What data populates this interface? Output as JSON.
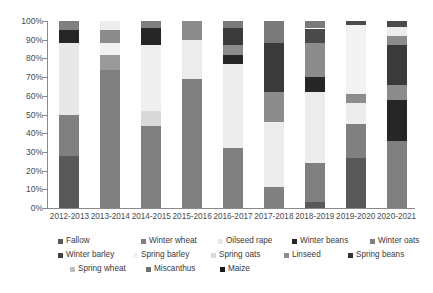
{
  "chart_data": {
    "type": "bar",
    "subtype": "stacked-percentage",
    "title": "",
    "xlabel": "",
    "ylabel": "",
    "ylim": [
      0,
      100
    ],
    "ytick_labels": [
      "0%",
      "10%",
      "20%",
      "30%",
      "40%",
      "50%",
      "60%",
      "70%",
      "80%",
      "90%",
      "100%"
    ],
    "ytick_values": [
      0,
      10,
      20,
      30,
      40,
      50,
      60,
      70,
      80,
      90,
      100
    ],
    "grid": false,
    "legend_position": "bottom",
    "categories": [
      "2012-2013",
      "2013-2014",
      "2014-2015",
      "2015-2016",
      "2016-2017",
      "2017-2018",
      "2018-2019",
      "2019-2020",
      "2020-2021"
    ],
    "series": [
      {
        "name": "Fallow",
        "color": "#595959",
        "values": [
          28,
          0,
          0,
          0,
          0,
          0,
          3,
          27,
          0
        ]
      },
      {
        "name": "Winter wheat",
        "color": "#808080",
        "values": [
          22,
          74,
          44,
          69,
          32,
          11,
          21,
          18,
          36
        ]
      },
      {
        "name": "Oilseed rape",
        "color": "#e8e8e8",
        "values": [
          38,
          8,
          8,
          21,
          45,
          35,
          38,
          11,
          0
        ]
      },
      {
        "name": "Winter beans",
        "color": "#262626",
        "values": [
          7,
          6,
          0,
          0,
          5,
          0,
          8,
          0,
          22
        ]
      },
      {
        "name": "Winter oats",
        "color": "#7f7f7f",
        "values": [
          5,
          0,
          0,
          0,
          0,
          0,
          0,
          5,
          8
        ]
      },
      {
        "name": "Winter barley",
        "color": "#404040",
        "values": [
          0,
          7,
          0,
          0,
          0,
          0,
          0,
          0,
          0
        ]
      },
      {
        "name": "Spring barley",
        "color": "#f2f2f2",
        "values": [
          0,
          5,
          35,
          0,
          0,
          0,
          0,
          37,
          0
        ]
      },
      {
        "name": "Spring oats",
        "color": "#d9d9d9",
        "values": [
          0,
          0,
          0,
          10,
          0,
          0,
          0,
          0,
          0
        ]
      },
      {
        "name": "Linseed",
        "color": "#8c8c8c",
        "values": [
          0,
          0,
          9,
          0,
          5,
          16,
          18,
          0,
          0
        ]
      },
      {
        "name": "Spring beans",
        "color": "#333333",
        "values": [
          0,
          0,
          4,
          0,
          9,
          26,
          8,
          0,
          21
        ]
      },
      {
        "name": "Spring wheat",
        "color": "#bfbfbf",
        "values": [
          0,
          0,
          0,
          0,
          0,
          0,
          0,
          0,
          5
        ]
      },
      {
        "name": "Miscanthus",
        "color": "#6e6e6e",
        "values": [
          0,
          0,
          0,
          0,
          4,
          12,
          4,
          0,
          5
        ]
      },
      {
        "name": "Maize",
        "color": "#1a1a1a",
        "values": [
          0,
          0,
          0,
          0,
          0,
          0,
          0,
          2,
          3
        ]
      }
    ],
    "stacks": [
      {
        "category": "2012-2013",
        "segments": [
          {
            "name": "Fallow",
            "from": 0,
            "to": 28,
            "color": "#595959"
          },
          {
            "name": "Winter wheat",
            "from": 28,
            "to": 50,
            "color": "#808080"
          },
          {
            "name": "Oilseed rape",
            "from": 50,
            "to": 88,
            "color": "#e8e8e8"
          },
          {
            "name": "Winter beans",
            "from": 88,
            "to": 95,
            "color": "#262626"
          },
          {
            "name": "Winter oats",
            "from": 95,
            "to": 100,
            "color": "#7f7f7f"
          }
        ]
      },
      {
        "category": "2013-2014",
        "segments": [
          {
            "name": "Winter wheat",
            "from": 0,
            "to": 74,
            "color": "#808080"
          },
          {
            "name": "Oilseed rape",
            "from": 74,
            "to": 82,
            "color": "#9a9a9a"
          },
          {
            "name": "Spring barley",
            "from": 82,
            "to": 88,
            "color": "#f2f2f2"
          },
          {
            "name": "Winter barley",
            "from": 88,
            "to": 95,
            "color": "#8c8c8c"
          },
          {
            "name": "Spring oats",
            "from": 95,
            "to": 100,
            "color": "#ededed"
          }
        ]
      },
      {
        "category": "2014-2015",
        "segments": [
          {
            "name": "Winter wheat",
            "from": 0,
            "to": 44,
            "color": "#808080"
          },
          {
            "name": "Oilseed rape",
            "from": 44,
            "to": 52,
            "color": "#d9d9d9"
          },
          {
            "name": "Spring barley",
            "from": 52,
            "to": 87,
            "color": "#efefef"
          },
          {
            "name": "Linseed",
            "from": 87,
            "to": 96,
            "color": "#262626"
          },
          {
            "name": "Spring beans",
            "from": 96,
            "to": 100,
            "color": "#7f7f7f"
          }
        ]
      },
      {
        "category": "2015-2016",
        "segments": [
          {
            "name": "Winter wheat",
            "from": 0,
            "to": 69,
            "color": "#808080"
          },
          {
            "name": "Oilseed rape",
            "from": 69,
            "to": 90,
            "color": "#ececec"
          },
          {
            "name": "Spring oats",
            "from": 90,
            "to": 100,
            "color": "#8c8c8c"
          }
        ]
      },
      {
        "category": "2016-2017",
        "segments": [
          {
            "name": "Winter wheat",
            "from": 0,
            "to": 32,
            "color": "#808080"
          },
          {
            "name": "Oilseed rape",
            "from": 32,
            "to": 77,
            "color": "#ececec"
          },
          {
            "name": "Winter beans",
            "from": 77,
            "to": 82,
            "color": "#262626"
          },
          {
            "name": "Linseed",
            "from": 82,
            "to": 87,
            "color": "#8c8c8c"
          },
          {
            "name": "Spring beans",
            "from": 87,
            "to": 96,
            "color": "#3a3a3a"
          },
          {
            "name": "Miscanthus",
            "from": 96,
            "to": 100,
            "color": "#7a7a7a"
          }
        ]
      },
      {
        "category": "2017-2018",
        "segments": [
          {
            "name": "Winter wheat",
            "from": 0,
            "to": 11,
            "color": "#808080"
          },
          {
            "name": "Oilseed rape",
            "from": 11,
            "to": 46,
            "color": "#ececec"
          },
          {
            "name": "Linseed",
            "from": 46,
            "to": 62,
            "color": "#8c8c8c"
          },
          {
            "name": "Spring beans",
            "from": 62,
            "to": 88,
            "color": "#3a3a3a"
          },
          {
            "name": "Miscanthus",
            "from": 88,
            "to": 100,
            "color": "#7a7a7a"
          }
        ]
      },
      {
        "category": "2018-2019",
        "segments": [
          {
            "name": "Fallow",
            "from": 0,
            "to": 3,
            "color": "#595959"
          },
          {
            "name": "Winter wheat",
            "from": 3,
            "to": 24,
            "color": "#808080"
          },
          {
            "name": "Oilseed rape",
            "from": 24,
            "to": 62,
            "color": "#ececec"
          },
          {
            "name": "Spring beans",
            "from": 62,
            "to": 70,
            "color": "#262626"
          },
          {
            "name": "Linseed",
            "from": 70,
            "to": 88,
            "color": "#8c8c8c"
          },
          {
            "name": "Miscanthus",
            "from": 88,
            "to": 96,
            "color": "#4a4a4a"
          },
          {
            "name": "Maize",
            "from": 96,
            "to": 100,
            "color": "#7a7a7a"
          }
        ]
      },
      {
        "category": "2019-2020",
        "segments": [
          {
            "name": "Fallow",
            "from": 0,
            "to": 27,
            "color": "#595959"
          },
          {
            "name": "Winter wheat",
            "from": 27,
            "to": 45,
            "color": "#808080"
          },
          {
            "name": "Spring barley",
            "from": 45,
            "to": 56,
            "color": "#ececec"
          },
          {
            "name": "Winter oats",
            "from": 56,
            "to": 61,
            "color": "#8c8c8c"
          },
          {
            "name": "Spring wheat",
            "from": 61,
            "to": 98,
            "color": "#f2f2f2"
          },
          {
            "name": "Maize",
            "from": 98,
            "to": 100,
            "color": "#4a4a4a"
          }
        ]
      },
      {
        "category": "2020-2021",
        "segments": [
          {
            "name": "Winter wheat",
            "from": 0,
            "to": 36,
            "color": "#808080"
          },
          {
            "name": "Winter beans",
            "from": 36,
            "to": 58,
            "color": "#262626"
          },
          {
            "name": "Winter oats",
            "from": 58,
            "to": 66,
            "color": "#8c8c8c"
          },
          {
            "name": "Spring beans",
            "from": 66,
            "to": 87,
            "color": "#3a3a3a"
          },
          {
            "name": "Miscanthus",
            "from": 87,
            "to": 92,
            "color": "#8c8c8c"
          },
          {
            "name": "Spring wheat",
            "from": 92,
            "to": 97,
            "color": "#ececec"
          },
          {
            "name": "Maize",
            "from": 97,
            "to": 100,
            "color": "#4a4a4a"
          }
        ]
      }
    ],
    "legend": {
      "rows": [
        [
          {
            "label": "Fallow",
            "color": "#595959",
            "x": 0
          },
          {
            "label": "Winter wheat",
            "color": "#808080",
            "x": 83
          },
          {
            "label": "Oilseed rape",
            "color": "#e8e8e8",
            "x": 160
          },
          {
            "label": "Winter beans",
            "color": "#262626",
            "x": 234
          },
          {
            "label": "Winter oats",
            "color": "#7f7f7f",
            "x": 312
          }
        ],
        [
          {
            "label": "Winter barley",
            "color": "#404040",
            "x": 0
          },
          {
            "label": "Spring barley",
            "color": "#f2f2f2",
            "x": 75
          },
          {
            "label": "Spring oats",
            "color": "#d9d9d9",
            "x": 153
          },
          {
            "label": "Linseed",
            "color": "#8c8c8c",
            "x": 226
          },
          {
            "label": "Spring beans",
            "color": "#333333",
            "x": 290
          }
        ],
        [
          {
            "label": "Spring wheat",
            "color": "#bfbfbf",
            "x": 12
          },
          {
            "label": "Miscanthus",
            "color": "#6e6e6e",
            "x": 88
          },
          {
            "label": "Maize",
            "color": "#1a1a1a",
            "x": 162
          }
        ]
      ]
    }
  }
}
